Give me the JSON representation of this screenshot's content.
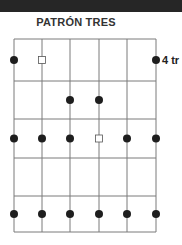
{
  "header": {
    "title": "PATRÓN TRES"
  },
  "diagram": {
    "type": "scale-pattern",
    "strings": 6,
    "fret_rows": 5,
    "position_label": "4 tr",
    "string_x": [
      14,
      42,
      70,
      99,
      127,
      156
    ],
    "fret_y": [
      39,
      81,
      119,
      158,
      196,
      232
    ],
    "notes": [
      {
        "string": 1,
        "row": 1,
        "marker": "dot"
      },
      {
        "string": 2,
        "row": 1,
        "marker": "square"
      },
      {
        "string": 6,
        "row": 1,
        "marker": "dot"
      },
      {
        "string": 3,
        "row": 2,
        "marker": "dot"
      },
      {
        "string": 4,
        "row": 2,
        "marker": "dot"
      },
      {
        "string": 1,
        "row": 3,
        "marker": "dot"
      },
      {
        "string": 2,
        "row": 3,
        "marker": "dot"
      },
      {
        "string": 3,
        "row": 3,
        "marker": "dot"
      },
      {
        "string": 4,
        "row": 3,
        "marker": "square"
      },
      {
        "string": 5,
        "row": 3,
        "marker": "dot"
      },
      {
        "string": 6,
        "row": 3,
        "marker": "dot"
      },
      {
        "string": 1,
        "row": 5,
        "marker": "dot"
      },
      {
        "string": 2,
        "row": 5,
        "marker": "dot"
      },
      {
        "string": 3,
        "row": 5,
        "marker": "dot"
      },
      {
        "string": 4,
        "row": 5,
        "marker": "dot"
      },
      {
        "string": 5,
        "row": 5,
        "marker": "dot"
      },
      {
        "string": 6,
        "row": 5,
        "marker": "dot"
      }
    ],
    "colors": {
      "line": "#7a7a7a",
      "dot": "#1e1e1e",
      "square_stroke": "#555555"
    }
  }
}
